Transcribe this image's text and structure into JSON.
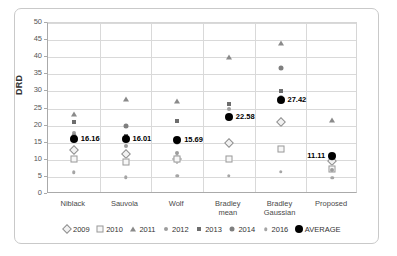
{
  "chart_data": {
    "type": "scatter",
    "title": "",
    "xlabel": "",
    "ylabel": "DRD",
    "ylim": [
      0,
      50
    ],
    "yticks": [
      0,
      5,
      10,
      15,
      20,
      25,
      30,
      35,
      40,
      45,
      50
    ],
    "grid": true,
    "legend_position": "bottom",
    "categories": [
      "Niblack",
      "Sauvola",
      "Wolf",
      "Bradley mean",
      "Bradley Gaussian",
      "Proposed"
    ],
    "category_lines": [
      "Niblack",
      "Sauvola",
      "Wolf",
      "Bradley|mean",
      "Bradley|Gaussian",
      "Proposed"
    ],
    "series": [
      {
        "name": "2009",
        "marker": "diamond-open",
        "values": [
          12.8,
          11.7,
          10.3,
          15.0,
          21.1,
          9.7
        ]
      },
      {
        "name": "2010",
        "marker": "square-open",
        "values": [
          10.3,
          9.5,
          10.1,
          10.3,
          13.1,
          7.2
        ]
      },
      {
        "name": "2011",
        "marker": "triangle",
        "values": [
          23.3,
          27.9,
          27.3,
          40.2,
          44.2,
          21.7
        ]
      },
      {
        "name": "2012",
        "marker": "dot",
        "values": [
          17.9,
          14.1,
          11.9,
          25.0,
          28.4,
          6.9
        ]
      },
      {
        "name": "2013",
        "marker": "square-filled",
        "values": [
          21.1,
          16.9,
          21.4,
          26.2,
          30.2,
          10.8
        ]
      },
      {
        "name": "2014",
        "marker": "circle-filled",
        "values": [
          16.9,
          19.8,
          15.3,
          22.1,
          36.8,
          10.5
        ]
      },
      {
        "name": "2016",
        "marker": "small-dot",
        "values": [
          6.3,
          4.9,
          5.3,
          5.3,
          6.5,
          4.7
        ]
      },
      {
        "name": "AVERAGE",
        "marker": "big-black-circle",
        "values": [
          16.16,
          16.01,
          15.69,
          22.58,
          27.42,
          11.11
        ]
      }
    ],
    "average_labels": [
      "16.16",
      "16.01",
      "15.69",
      "22.58",
      "27.42",
      "11.11"
    ],
    "average_label_side": [
      "right",
      "right",
      "right",
      "right",
      "right",
      "left"
    ]
  },
  "colors": {
    "average": "#000000",
    "grid": "#d9d9d9",
    "axis": "#aaaaaa",
    "text": "#333333",
    "frame": "#c9c9c9",
    "background": "#ffffff"
  },
  "legend": {
    "items": [
      {
        "label": "2009"
      },
      {
        "label": "2010"
      },
      {
        "label": "2011"
      },
      {
        "label": "2012"
      },
      {
        "label": "2013"
      },
      {
        "label": "2014"
      },
      {
        "label": "2016"
      },
      {
        "label": "AVERAGE"
      }
    ]
  }
}
